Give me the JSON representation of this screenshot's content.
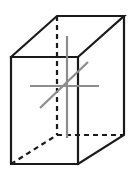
{
  "figure": {
    "width": 134,
    "height": 174,
    "background_color": "#ffffff",
    "solid_edge_color": "#1a1a1a",
    "hidden_edge_color": "#1a1a1a",
    "axis_line_color": "#8c8c8c",
    "solid_edge_width": 2.2,
    "hidden_edge_width": 2.2,
    "hidden_dash_pattern": "5,4",
    "axis_line_width": 2.2,
    "vertices": {
      "front_top_left": [
        11,
        57
      ],
      "front_top_right": [
        78,
        57
      ],
      "front_bottom_right": [
        78,
        164
      ],
      "front_bottom_left": [
        11,
        164
      ],
      "back_top_left": [
        57,
        16
      ],
      "back_top_right": [
        124,
        16
      ],
      "back_bottom_right": [
        124,
        135
      ],
      "back_bottom_left": [
        57,
        135
      ]
    },
    "visible_edges": [
      {
        "name": "front-face",
        "points": "11,57 78,57 78,164 11,164 11,57"
      },
      {
        "name": "top-face-back-left",
        "points": "11,57 57,16 124,16 78,57"
      },
      {
        "name": "right-face-back",
        "points": "78,164 124,135 124,16"
      }
    ],
    "hidden_edges": [
      {
        "name": "hidden-edge-back-left-vertical",
        "x1": 57,
        "y1": 16,
        "x2": 57,
        "y2": 135
      },
      {
        "name": "hidden-edge-back-bottom-horizontal",
        "x1": 57,
        "y1": 135,
        "x2": 124,
        "y2": 135
      },
      {
        "name": "hidden-edge-bottom-left-diagonal",
        "x1": 11,
        "y1": 164,
        "x2": 57,
        "y2": 135
      }
    ],
    "axis_lines": [
      {
        "name": "axis-line-horizontal",
        "x1": 30,
        "y1": 86,
        "x2": 99,
        "y2": 86
      },
      {
        "name": "axis-line-vertical",
        "x1": 67,
        "y1": 36,
        "x2": 67,
        "y2": 138
      },
      {
        "name": "axis-line-diagonal",
        "x1": 40,
        "y1": 108,
        "x2": 88,
        "y2": 62
      }
    ]
  }
}
